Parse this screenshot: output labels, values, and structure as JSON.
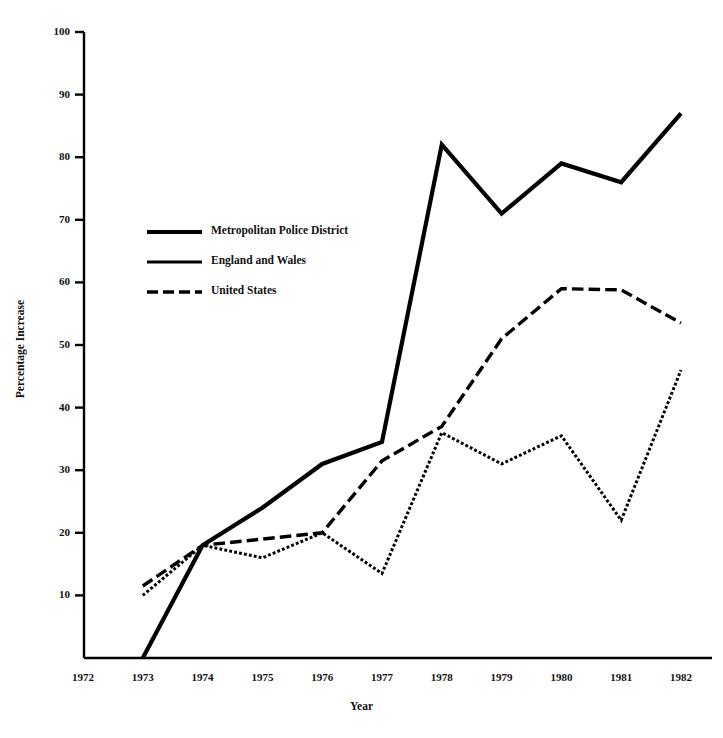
{
  "chart_data": {
    "type": "line",
    "title": "",
    "xlabel": "Year",
    "ylabel": "Percentage Increase",
    "grid": false,
    "legend_position": "upper-left-inside",
    "xlim": [
      1972,
      1982
    ],
    "ylim": [
      0,
      100
    ],
    "x_ticks": [
      1972,
      1973,
      1974,
      1975,
      1976,
      1977,
      1978,
      1979,
      1980,
      1981,
      1982
    ],
    "y_ticks": [
      0,
      10,
      20,
      30,
      40,
      50,
      60,
      70,
      80,
      90,
      100
    ],
    "y_tick_labels": [
      "",
      "10",
      "20",
      "30",
      "40",
      "50",
      "60",
      "70",
      "80",
      "90",
      "100"
    ],
    "x_tick_labels": [
      "1972",
      "1973",
      "1974",
      "1975",
      "1976",
      "1977",
      "1978",
      "1979",
      "1980",
      "1981",
      "1982"
    ],
    "series": [
      {
        "name": "Metropolitan Police District",
        "style": "solid",
        "width": 4.2,
        "color": "#000000",
        "x": [
          1973,
          1974,
          1975,
          1976,
          1977,
          1978,
          1979,
          1980,
          1981,
          1982
        ],
        "values": [
          0,
          18,
          24,
          31,
          34.5,
          82,
          71,
          79,
          76,
          87
        ]
      },
      {
        "name": "England and Wales",
        "style": "dotted",
        "width": 3.0,
        "color": "#000000",
        "x": [
          1973,
          1974,
          1975,
          1976,
          1977,
          1978,
          1979,
          1980,
          1981,
          1982
        ],
        "values": [
          10,
          18,
          16,
          20,
          13.5,
          36,
          31,
          35.5,
          22,
          46
        ]
      },
      {
        "name": "United States",
        "style": "dashed",
        "width": 3.4,
        "color": "#000000",
        "x": [
          1973,
          1974,
          1975,
          1976,
          1977,
          1978,
          1979,
          1980,
          1981,
          1982
        ],
        "values": [
          11.5,
          18,
          19,
          20,
          31.5,
          37,
          51,
          59,
          58.8,
          53.5
        ]
      }
    ]
  },
  "legend": {
    "items": [
      {
        "label": "Metropolitan Police District",
        "style": "solid",
        "width": 4.2
      },
      {
        "label": "England and Wales",
        "style": "solid-thin",
        "width": 3.0
      },
      {
        "label": "United States",
        "style": "dashed",
        "width": 3.4
      }
    ]
  },
  "axes": {
    "y_title": "Percentage Increase",
    "x_title": "Year"
  },
  "colors": {
    "ink": "#000000",
    "background": "#ffffff"
  }
}
